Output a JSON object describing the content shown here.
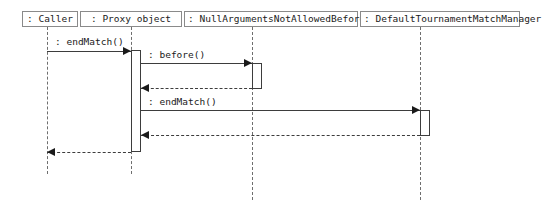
{
  "diagram": {
    "type": "uml-sequence-diagram",
    "width": 543,
    "height": 218,
    "background_color": "#ffffff",
    "line_color": "#3d3d3d",
    "lifeline_color": "#6e6e6e",
    "box_border_color": "#8a8a8a",
    "text_color": "#1a1a1a"
  },
  "participants": [
    {
      "id": "caller",
      "label": ": Caller",
      "box_x": 22,
      "box_y": 11,
      "box_width": 56,
      "lifeline_x": 47,
      "lifeline_bottom": 174
    },
    {
      "id": "proxy",
      "label": ": Proxy object",
      "box_x": 80,
      "box_y": 11,
      "box_width": 102,
      "lifeline_x": 131,
      "lifeline_bottom": 174
    },
    {
      "id": "beforeadvice",
      "label": ": NullArgumentsNotAllowedBeforeAdvice",
      "box_x": 184,
      "box_y": 11,
      "box_width": 174,
      "lifeline_x": 252,
      "lifeline_bottom": 200
    },
    {
      "id": "matchmanager",
      "label": ": DefaultTournamentMatchManager",
      "box_x": 360,
      "box_y": 11,
      "box_width": 160,
      "lifeline_x": 420,
      "lifeline_bottom": 200
    }
  ],
  "activations": [
    {
      "id": "activation-proxy",
      "x": 131,
      "y": 50,
      "width": 10,
      "height": 102
    },
    {
      "id": "activation-beforeadvice",
      "x": 252,
      "y": 63,
      "width": 10,
      "height": 26
    },
    {
      "id": "activation-matchmanager",
      "x": 420,
      "y": 110,
      "width": 10,
      "height": 26
    }
  ],
  "messages": [
    {
      "id": "message-endmatch-caller-proxy",
      "label": ": endMatch()",
      "style": "solid",
      "direction": "right",
      "from": "caller",
      "to": "proxy",
      "x_start": 47,
      "x_end": 131,
      "y": 51,
      "label_x": 55,
      "label_y": 36
    },
    {
      "id": "message-before-proxy-beforeadvice",
      "label": ": before()",
      "style": "solid",
      "direction": "right",
      "from": "proxy",
      "to": "beforeadvice",
      "x_start": 141,
      "x_end": 252,
      "y": 63,
      "label_x": 148,
      "label_y": 49
    },
    {
      "id": "return-beforeadvice-proxy",
      "label": "",
      "style": "dashed",
      "direction": "left",
      "from": "beforeadvice",
      "to": "proxy",
      "x_start": 141,
      "x_end": 252,
      "y": 88,
      "label_x": 0,
      "label_y": 0
    },
    {
      "id": "message-endmatch-proxy-matchmanager",
      "label": ": endMatch()",
      "style": "solid",
      "direction": "right",
      "from": "proxy",
      "to": "matchmanager",
      "x_start": 141,
      "x_end": 420,
      "y": 110,
      "label_x": 148,
      "label_y": 96
    },
    {
      "id": "return-matchmanager-proxy",
      "label": "",
      "style": "dashed",
      "direction": "left",
      "from": "matchmanager",
      "to": "proxy",
      "x_start": 141,
      "x_end": 420,
      "y": 135,
      "label_x": 0,
      "label_y": 0
    },
    {
      "id": "return-proxy-caller",
      "label": "",
      "style": "dashed",
      "direction": "left",
      "from": "proxy",
      "to": "caller",
      "x_start": 47,
      "x_end": 131,
      "y": 152,
      "label_x": 0,
      "label_y": 0
    }
  ]
}
